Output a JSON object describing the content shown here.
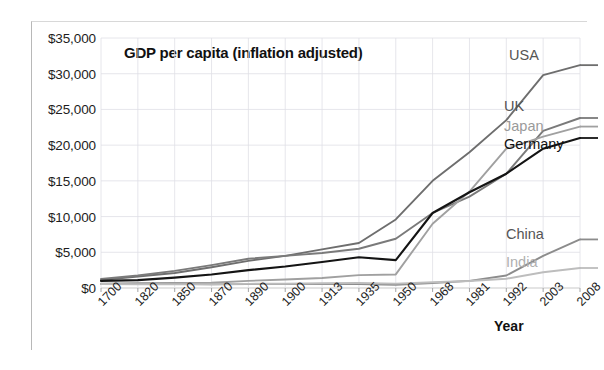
{
  "chart_data": {
    "type": "line",
    "title": "GDP per capita (inflation adjusted)",
    "xlabel": "Year",
    "ylabel": "",
    "grid": true,
    "legend_position": "inline-right-end-labels",
    "categories": [
      "1700",
      "1820",
      "1850",
      "1870",
      "1890",
      "1900",
      "1913",
      "1935",
      "1950",
      "1968",
      "1981",
      "1992",
      "2003",
      "2008"
    ],
    "ylim": [
      0,
      35000
    ],
    "ytick_labels": [
      "$0",
      "$5,000",
      "$10,000",
      "$15,000",
      "$20,000",
      "$25,000",
      "$30,000",
      "$35,000"
    ],
    "ytick_values": [
      0,
      5000,
      10000,
      15000,
      20000,
      25000,
      30000,
      35000
    ],
    "series": [
      {
        "name": "USA",
        "color": "#6e6e6e",
        "label_color": "#555555",
        "values": [
          1100,
          1600,
          2100,
          2900,
          3800,
          4500,
          5400,
          6300,
          9600,
          15000,
          19000,
          23500,
          29800,
          31200
        ]
      },
      {
        "name": "UK",
        "color": "#7a7a7a",
        "label_color": "#555555",
        "values": [
          1250,
          1750,
          2400,
          3200,
          4100,
          4500,
          4900,
          5500,
          6900,
          10500,
          12800,
          16000,
          22000,
          23800
        ]
      },
      {
        "name": "Japan",
        "color": "#a0a0a0",
        "label_color": "#9a9a9a",
        "values": [
          570,
          670,
          720,
          740,
          1000,
          1180,
          1390,
          1800,
          1900,
          9000,
          13500,
          19500,
          21200,
          22600
        ]
      },
      {
        "name": "Germany",
        "color": "#141414",
        "label_color": "#111111",
        "values": [
          1000,
          1100,
          1450,
          1900,
          2500,
          3000,
          3650,
          4300,
          3900,
          10500,
          13400,
          16000,
          19500,
          21000
        ]
      },
      {
        "name": "China",
        "color": "#8c8c8c",
        "label_color": "#555555",
        "values": [
          600,
          600,
          600,
          530,
          540,
          545,
          552,
          560,
          448,
          700,
          1000,
          1750,
          4500,
          6800
        ]
      },
      {
        "name": "India",
        "color": "#bdbdbd",
        "label_color": "#b0b0b0",
        "values": [
          550,
          530,
          530,
          533,
          584,
          599,
          673,
          700,
          619,
          800,
          980,
          1300,
          2200,
          2800
        ]
      }
    ]
  },
  "labels": {
    "usa": "USA",
    "uk": "UK",
    "japan": "Japan",
    "germany": "Germany",
    "china": "China",
    "india": "India"
  }
}
